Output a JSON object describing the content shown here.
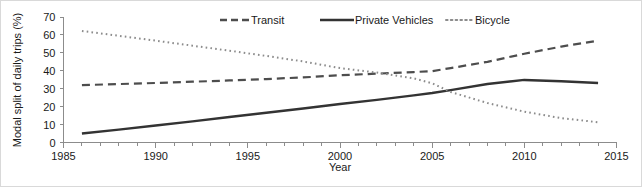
{
  "chart_data": {
    "type": "line",
    "title": "",
    "xlabel": "Year",
    "ylabel": "Modal split of daily trips (%)",
    "xlim": [
      1985,
      2015
    ],
    "ylim": [
      0,
      70
    ],
    "grid": false,
    "legend_position": "top-center",
    "xticks": [
      1985,
      1990,
      1995,
      2000,
      2005,
      2010,
      2015
    ],
    "xtick_labels": [
      "1985",
      "1990",
      "1995",
      "2000",
      "2005",
      "2010",
      "2015"
    ],
    "xminor_tick_step": 1,
    "yticks": [
      0,
      10,
      20,
      30,
      40,
      50,
      60,
      70
    ],
    "ytick_labels": [
      "0",
      "10",
      "20",
      "30",
      "40",
      "50",
      "60",
      "70"
    ],
    "x": [
      1986,
      1988,
      1990,
      1992,
      1994,
      1996,
      1998,
      2000,
      2002,
      2004,
      2005,
      2006,
      2008,
      2010,
      2012,
      2014
    ],
    "series": [
      {
        "name": "Transit",
        "style": "dashed",
        "color": "#4d4d4d",
        "width": 2.2,
        "dasharray": "8,5",
        "values": [
          32.0,
          32.6,
          33.2,
          33.9,
          34.6,
          35.4,
          36.3,
          37.5,
          38.4,
          39.3,
          39.8,
          41.5,
          45.0,
          49.5,
          53.5,
          56.8
        ]
      },
      {
        "name": "Private Vehicles",
        "style": "solid",
        "color": "#333333",
        "width": 2.4,
        "dasharray": "none",
        "values": [
          5.0,
          7.2,
          9.5,
          11.8,
          14.2,
          16.6,
          19.0,
          21.5,
          23.8,
          26.3,
          27.6,
          29.2,
          32.6,
          34.9,
          34.2,
          33.2
        ]
      },
      {
        "name": "Bicycle",
        "style": "dotted",
        "color": "#8c8c8c",
        "width": 2.0,
        "dasharray": "1.6,3.2",
        "values": [
          62.2,
          59.5,
          56.8,
          54.0,
          51.2,
          48.3,
          45.2,
          41.5,
          39.0,
          35.8,
          33.0,
          28.2,
          22.0,
          17.2,
          13.6,
          11.3
        ]
      }
    ],
    "legend": [
      {
        "label": "Transit",
        "style": "dashed",
        "color": "#4d4d4d"
      },
      {
        "label": "Private Vehicles",
        "style": "solid",
        "color": "#333333"
      },
      {
        "label": "Bicycle",
        "style": "dotted",
        "color": "#8c8c8c"
      }
    ]
  },
  "colors": {
    "background": "#ffffff",
    "frame_border": "#d9d9d9",
    "axis": "#8c8c8c",
    "text": "#1a1a1a"
  }
}
